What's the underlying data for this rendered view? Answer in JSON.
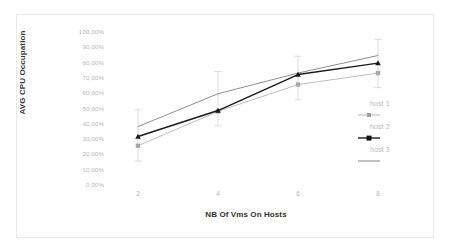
{
  "chart_data": {
    "type": "line",
    "title": "",
    "xlabel": "NB Of Vms On Hosts",
    "ylabel": "AVG CPU Occupation",
    "x": [
      2,
      4,
      6,
      8
    ],
    "xticklabels": [
      "2",
      "4",
      "6",
      "8"
    ],
    "yticklabels": [
      "100,00%",
      "90,00%",
      "80,00%",
      "70,00%",
      "60,00%",
      "50,00%",
      "40,00%",
      "30,00%",
      "20,00%",
      "10,00%",
      "0,00%"
    ],
    "ytickvalues": [
      100,
      90,
      80,
      70,
      60,
      50,
      40,
      30,
      20,
      10,
      0
    ],
    "ylim": [
      0,
      100
    ],
    "xlim": [
      1,
      9
    ],
    "grid": false,
    "legend_position": "right",
    "units": "percent",
    "series": [
      {
        "name": "host 1",
        "color": "#b5b5b5",
        "marker": "square",
        "values": [
          25.0,
          47.5,
          65.0,
          72.5
        ],
        "errors_low": [
          15.0,
          38.0,
          55.0,
          63.0
        ],
        "errors_high": [
          35.0,
          58.0,
          75.0,
          82.0
        ]
      },
      {
        "name": "host 2",
        "color": "#1a1a1a",
        "marker": "triangle",
        "values": [
          31.0,
          48.0,
          71.5,
          79.0
        ],
        "errors_low": [
          15.0,
          38.0,
          55.0,
          63.0
        ],
        "errors_high": [
          48.5,
          73.5,
          83.5,
          94.5
        ]
      },
      {
        "name": "host 3",
        "color": "#8f8f8f",
        "marker": "none",
        "values": [
          37.5,
          59.0,
          72.5,
          84.0
        ],
        "errors_low": [
          15.0,
          38.0,
          55.0,
          63.0
        ],
        "errors_high": [
          48.5,
          73.5,
          83.5,
          94.5
        ]
      }
    ],
    "legend": [
      {
        "label": "host 1",
        "color": "#b5b5b5",
        "marker": "square"
      },
      {
        "label": "host 2",
        "color": "#1a1a1a",
        "marker": "square"
      },
      {
        "label": "host 3",
        "color": "#8f8f8f",
        "marker": "none"
      }
    ],
    "colors": {
      "host1": "#b5b5b5",
      "host2": "#1a1a1a",
      "host3": "#8f8f8f",
      "errorbar": "#d8d8d8",
      "tick_text": "#b7b7b7",
      "axis_title": "#333333",
      "frame": "#e9e9e9",
      "background": "#ffffff"
    }
  }
}
